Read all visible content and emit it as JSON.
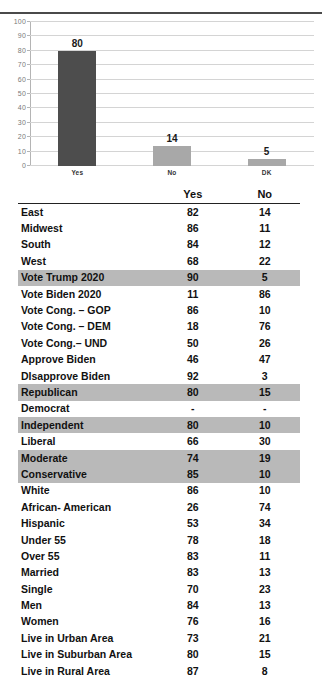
{
  "chart_data": {
    "type": "bar",
    "title": "",
    "xlabel": "",
    "ylabel": "",
    "categories": [
      "Yes",
      "No",
      "DK"
    ],
    "values": [
      80,
      14,
      5
    ],
    "ylim": [
      0,
      100
    ],
    "yticks": [
      0,
      10,
      20,
      30,
      40,
      50,
      60,
      70,
      80,
      90,
      100
    ],
    "grid": true,
    "legend": false,
    "bar_colors": [
      "#4d4d4d",
      "#a8a8a8",
      "#a8a8a8"
    ],
    "data_labels": [
      "80",
      "14",
      "5"
    ]
  },
  "table": {
    "columns": [
      "",
      "Yes",
      "No"
    ],
    "rows": [
      {
        "label": "East",
        "yes": "82",
        "no": "14",
        "highlight": false
      },
      {
        "label": "Midwest",
        "yes": "86",
        "no": "11",
        "highlight": false
      },
      {
        "label": "South",
        "yes": "84",
        "no": "12",
        "highlight": false
      },
      {
        "label": "West",
        "yes": "68",
        "no": "22",
        "highlight": false
      },
      {
        "label": "Vote Trump 2020",
        "yes": "90",
        "no": "5",
        "highlight": true
      },
      {
        "label": "Vote Biden 2020",
        "yes": "11",
        "no": "86",
        "highlight": false
      },
      {
        "label": "Vote Cong. – GOP",
        "yes": "86",
        "no": "10",
        "highlight": false
      },
      {
        "label": "Vote Cong. – DEM",
        "yes": "18",
        "no": "76",
        "highlight": false
      },
      {
        "label": "Vote Cong.– UND",
        "yes": "50",
        "no": "26",
        "highlight": false
      },
      {
        "label": "Approve Biden",
        "yes": "46",
        "no": "47",
        "highlight": false
      },
      {
        "label": "DIsapprove Biden",
        "yes": "92",
        "no": "3",
        "highlight": false
      },
      {
        "label": "Republican",
        "yes": "80",
        "no": "15",
        "highlight": true
      },
      {
        "label": "Democrat",
        "yes": "-",
        "no": "-",
        "highlight": false
      },
      {
        "label": "Independent",
        "yes": "80",
        "no": "10",
        "highlight": true
      },
      {
        "label": "Liberal",
        "yes": "66",
        "no": "30",
        "highlight": false
      },
      {
        "label": "Moderate",
        "yes": "74",
        "no": "19",
        "highlight": true
      },
      {
        "label": "Conservative",
        "yes": "85",
        "no": "10",
        "highlight": true
      },
      {
        "label": "White",
        "yes": "86",
        "no": "10",
        "highlight": false
      },
      {
        "label": "African- American",
        "yes": "26",
        "no": "74",
        "highlight": false
      },
      {
        "label": "Hispanic",
        "yes": "53",
        "no": "34",
        "highlight": false
      },
      {
        "label": "Under 55",
        "yes": "78",
        "no": "18",
        "highlight": false
      },
      {
        "label": "Over 55",
        "yes": "83",
        "no": "11",
        "highlight": false
      },
      {
        "label": "Married",
        "yes": "83",
        "no": "13",
        "highlight": false
      },
      {
        "label": "Single",
        "yes": "70",
        "no": "23",
        "highlight": false
      },
      {
        "label": "Men",
        "yes": "84",
        "no": "13",
        "highlight": false
      },
      {
        "label": "Women",
        "yes": "76",
        "no": "16",
        "highlight": false
      },
      {
        "label": "Live in Urban Area",
        "yes": "73",
        "no": "21",
        "highlight": false
      },
      {
        "label": "Live in Suburban Area",
        "yes": "80",
        "no": "15",
        "highlight": false
      },
      {
        "label": "Live in Rural Area",
        "yes": "87",
        "no": "8",
        "highlight": false
      }
    ]
  }
}
